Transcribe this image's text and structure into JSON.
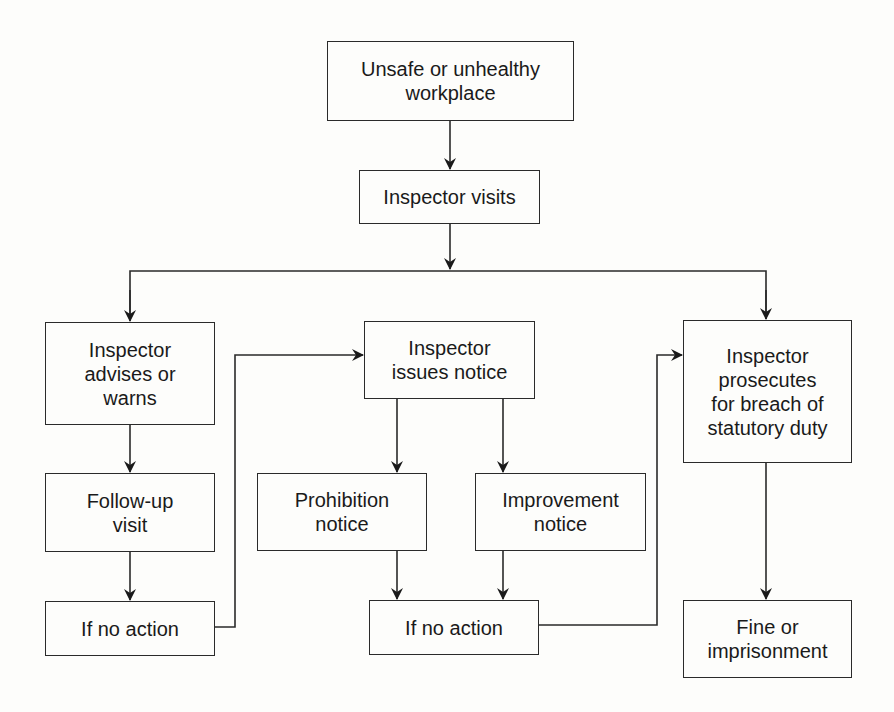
{
  "diagram": {
    "type": "flowchart",
    "nodes": [
      {
        "id": "n1",
        "label": "Unsafe or unhealthy\nworkplace"
      },
      {
        "id": "n2",
        "label": "Inspector visits"
      },
      {
        "id": "n3",
        "label": "Inspector\nadvises or\nwarns"
      },
      {
        "id": "n4",
        "label": "Inspector\nissues notice"
      },
      {
        "id": "n5",
        "label": "Inspector\nprosecutes\nfor breach of\nstatutory duty"
      },
      {
        "id": "n6",
        "label": "Follow-up\nvisit"
      },
      {
        "id": "n7",
        "label": "Prohibition\nnotice"
      },
      {
        "id": "n8",
        "label": "Improvement\nnotice"
      },
      {
        "id": "n9",
        "label": "If no action"
      },
      {
        "id": "n10",
        "label": "If no action"
      },
      {
        "id": "n11",
        "label": "Fine or\nimprisonment"
      }
    ],
    "edges": [
      {
        "from": "n1",
        "to": "n2"
      },
      {
        "from": "n2",
        "to": "n3"
      },
      {
        "from": "n2",
        "to": "n5"
      },
      {
        "from": "n3",
        "to": "n6"
      },
      {
        "from": "n6",
        "to": "n9"
      },
      {
        "from": "n9",
        "to": "n4"
      },
      {
        "from": "n4",
        "to": "n7"
      },
      {
        "from": "n4",
        "to": "n8"
      },
      {
        "from": "n7",
        "to": "n10"
      },
      {
        "from": "n8",
        "to": "n10"
      },
      {
        "from": "n10",
        "to": "n5"
      },
      {
        "from": "n5",
        "to": "n11"
      }
    ],
    "colors": {
      "line": "#2a2a2a",
      "background": "#fdfdfb",
      "text": "#1a1a1a"
    }
  }
}
